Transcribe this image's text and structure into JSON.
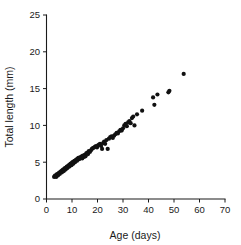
{
  "chart_data": {
    "type": "scatter",
    "title": "",
    "xlabel": "Age (days)",
    "ylabel": "Total length (mm)",
    "xlim": [
      0,
      70
    ],
    "ylim": [
      0,
      25
    ],
    "xticks": [
      0,
      10,
      20,
      30,
      40,
      50,
      60,
      70
    ],
    "yticks": [
      0,
      5,
      10,
      15,
      20,
      25
    ],
    "grid": false,
    "legend": null,
    "marker": {
      "shape": "circle",
      "color": "#111111",
      "size": 2.1
    },
    "series": [
      {
        "name": "Total length vs age",
        "x": [
          3.0,
          3.2,
          3.5,
          3.8,
          4.0,
          4.2,
          4.5,
          4.8,
          5.0,
          5.2,
          5.5,
          5.8,
          6.0,
          6.2,
          6.5,
          6.8,
          7.0,
          7.2,
          7.5,
          7.8,
          8.0,
          8.2,
          8.5,
          8.8,
          9.0,
          9.2,
          9.5,
          9.8,
          10.0,
          10.2,
          10.5,
          10.8,
          11.0,
          11.2,
          11.5,
          11.8,
          12.0,
          12.3,
          12.5,
          12.8,
          13.0,
          13.3,
          13.5,
          13.8,
          14.0,
          14.3,
          14.6,
          15.0,
          15.3,
          15.6,
          16.0,
          16.3,
          16.6,
          17.0,
          17.4,
          17.8,
          18.2,
          18.6,
          19.0,
          19.4,
          19.8,
          20.2,
          20.6,
          21.0,
          21.4,
          21.8,
          22.2,
          22.6,
          23.0,
          23.5,
          24.0,
          24.5,
          25.0,
          25.5,
          26.0,
          26.5,
          27.0,
          27.5,
          28.0,
          28.5,
          29.0,
          29.5,
          30.0,
          30.5,
          31.0,
          31.5,
          32.0,
          32.5,
          33.0,
          33.5,
          34.0,
          34.5,
          35.5,
          37.5,
          41.8,
          42.3,
          43.5,
          47.8,
          48.2,
          53.8
        ],
        "y": [
          3.0,
          3.1,
          3.2,
          3.0,
          3.3,
          3.4,
          3.2,
          3.5,
          3.6,
          3.4,
          3.7,
          3.8,
          3.6,
          3.9,
          4.0,
          3.8,
          4.1,
          4.2,
          4.0,
          4.3,
          4.4,
          4.2,
          4.5,
          4.6,
          4.4,
          4.7,
          4.8,
          4.6,
          4.9,
          5.0,
          4.8,
          5.1,
          5.2,
          5.0,
          5.3,
          5.4,
          5.2,
          5.5,
          5.6,
          5.4,
          5.5,
          5.7,
          5.6,
          5.8,
          5.5,
          5.9,
          5.7,
          6.0,
          5.8,
          6.2,
          6.3,
          6.1,
          6.5,
          6.4,
          6.6,
          6.8,
          6.9,
          7.0,
          7.1,
          7.2,
          7.0,
          7.3,
          7.4,
          7.5,
          7.2,
          6.8,
          7.6,
          7.8,
          7.5,
          8.0,
          6.8,
          8.2,
          8.4,
          8.5,
          8.3,
          8.6,
          8.8,
          9.0,
          8.9,
          9.2,
          9.4,
          9.3,
          9.6,
          10.0,
          10.2,
          9.9,
          10.4,
          10.6,
          10.3,
          11.0,
          11.2,
          10.0,
          11.5,
          12.0,
          13.8,
          12.8,
          14.2,
          14.5,
          14.7,
          17.0
        ]
      }
    ]
  }
}
